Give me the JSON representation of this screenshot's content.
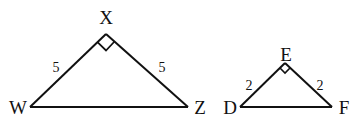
{
  "diagram": {
    "stroke_color": "#111111",
    "background": "#ffffff",
    "triangles": [
      {
        "name": "WXZ",
        "vertices": {
          "apex": {
            "label": "X",
            "right_angle": true
          },
          "left": {
            "label": "W"
          },
          "right": {
            "label": "Z"
          }
        },
        "sides": {
          "left": "5",
          "right": "5"
        }
      },
      {
        "name": "DEF",
        "vertices": {
          "apex": {
            "label": "E",
            "right_angle": true
          },
          "left": {
            "label": "D"
          },
          "right": {
            "label": "F"
          }
        },
        "sides": {
          "left": "2",
          "right": "2"
        }
      }
    ]
  }
}
